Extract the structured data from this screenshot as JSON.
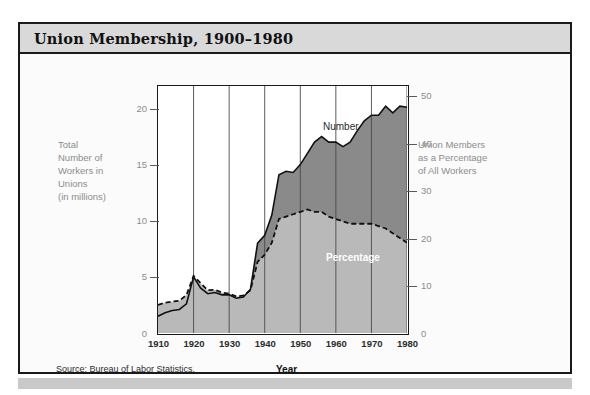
{
  "card": {
    "title": "Union Membership,  1900–1980",
    "source": "Source: Bureau of Labor Statistics."
  },
  "axes": {
    "left_title": "Total\nNumber of\nWorkers in\nUnions\n(in millions)",
    "right_title": "Union Members\nas a Percentage\nof All Workers",
    "x_title": "Year",
    "left_ticks": [
      "20",
      "15",
      "10",
      "5",
      "0"
    ],
    "right_ticks": [
      "50",
      "40",
      "30",
      "20",
      "10",
      "0"
    ],
    "x_ticks": [
      "1910",
      "1920",
      "1930",
      "1940",
      "1950",
      "1960",
      "1970",
      "1980"
    ]
  },
  "series_labels": {
    "number": "Number",
    "percentage": "Percentage"
  },
  "colors": {
    "number_area": "#8a8a8a",
    "percentage_area": "#b9b9b9",
    "frame": "#1a1a1a",
    "titlebar": "#d9d9d9",
    "axis_text": "#8c8c8c"
  },
  "chart_data": {
    "type": "area",
    "title": "Union Membership, 1900–1980",
    "xlabel": "Year",
    "ylabel": "Total Number of Workers in Unions (in millions)",
    "y2label": "Union Members as a Percentage of All Workers",
    "xlim": [
      1910,
      1980
    ],
    "ylim": [
      0,
      22
    ],
    "y2lim": [
      0,
      52
    ],
    "grid": "vertical-decades",
    "legend": "inline-annotations",
    "x": [
      1910,
      1912,
      1914,
      1916,
      1918,
      1920,
      1922,
      1924,
      1926,
      1928,
      1930,
      1932,
      1934,
      1936,
      1938,
      1940,
      1942,
      1944,
      1946,
      1948,
      1950,
      1952,
      1954,
      1956,
      1958,
      1960,
      1962,
      1964,
      1966,
      1968,
      1970,
      1972,
      1974,
      1976,
      1978,
      1980
    ],
    "series": [
      {
        "name": "Number",
        "unit": "millions of workers",
        "axis": "left",
        "values": [
          1.5,
          1.8,
          2.0,
          2.1,
          2.6,
          5.0,
          4.0,
          3.5,
          3.6,
          3.4,
          3.4,
          3.1,
          3.2,
          3.9,
          8.0,
          8.7,
          10.5,
          14.1,
          14.4,
          14.3,
          15.0,
          16.0,
          17.0,
          17.5,
          17.0,
          17.0,
          16.6,
          17.0,
          18.0,
          18.9,
          19.4,
          19.4,
          20.2,
          19.6,
          20.2,
          20.1
        ]
      },
      {
        "name": "Percentage",
        "unit": "percent of all workers",
        "axis": "right",
        "values": [
          5.9,
          6.4,
          6.6,
          6.8,
          8.0,
          12.0,
          10.5,
          9.0,
          9.1,
          8.5,
          8.3,
          7.7,
          7.9,
          9.0,
          15.0,
          16.5,
          19.0,
          24.0,
          24.5,
          25.0,
          25.5,
          26.0,
          25.5,
          25.5,
          24.5,
          24.0,
          23.5,
          23.0,
          23.0,
          23.0,
          23.0,
          22.5,
          22.0,
          21.0,
          20.0,
          19.0
        ]
      }
    ]
  }
}
